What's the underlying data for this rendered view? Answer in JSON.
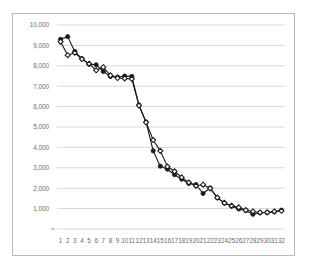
{
  "chart_data": {
    "type": "line",
    "title": "",
    "xlabel": "",
    "ylabel": "",
    "grid": true,
    "legend": "none",
    "xlim": [
      0.5,
      32.5
    ],
    "ylim": [
      0,
      10000
    ],
    "categories": [
      1,
      2,
      3,
      4,
      5,
      6,
      7,
      8,
      9,
      10,
      11,
      12,
      13,
      14,
      15,
      16,
      17,
      18,
      19,
      20,
      21,
      22,
      23,
      24,
      25,
      26,
      27,
      28,
      29,
      30,
      31,
      32
    ],
    "x_tick_labels": [
      "1",
      "2",
      "3",
      "4",
      "5",
      "6",
      "7",
      "8",
      "9",
      "10",
      "11",
      "12",
      "13",
      "14",
      "15",
      "16",
      "17",
      "18",
      "19",
      "20",
      "21",
      "22",
      "23",
      "24",
      "25",
      "26",
      "27",
      "28",
      "29",
      "30",
      "31",
      "32"
    ],
    "y_tick_labels": [
      "1,000",
      "2,000",
      "3,000",
      "4,000",
      "5,000",
      "6,000",
      "7,000",
      "8,000",
      "9,000",
      "10,000"
    ],
    "y_tick_values": [
      1000,
      2000,
      3000,
      4000,
      5000,
      6000,
      7000,
      8000,
      9000,
      10000
    ],
    "series": [
      {
        "name": "Series 1",
        "marker": "filled-circle",
        "color": "#1a1a1a",
        "values": [
          9300,
          9430,
          8700,
          8350,
          8080,
          8050,
          7720,
          7480,
          7450,
          7500,
          7480,
          6080,
          5240,
          3830,
          3080,
          2930,
          2660,
          2440,
          2230,
          2180,
          1740,
          2010,
          1530,
          1270,
          1120,
          980,
          900,
          720,
          800,
          800,
          840,
          920
        ]
      },
      {
        "name": "Series 2",
        "marker": "open-diamond",
        "color": "#1a1a1a",
        "values": [
          9180,
          8520,
          8640,
          8330,
          8100,
          7780,
          7930,
          7530,
          7400,
          7380,
          7360,
          6050,
          5230,
          4360,
          3830,
          3060,
          2830,
          2530,
          2280,
          2120,
          2170,
          1990,
          1540,
          1280,
          1140,
          1060,
          930,
          860,
          810,
          820,
          860,
          890
        ]
      }
    ]
  }
}
